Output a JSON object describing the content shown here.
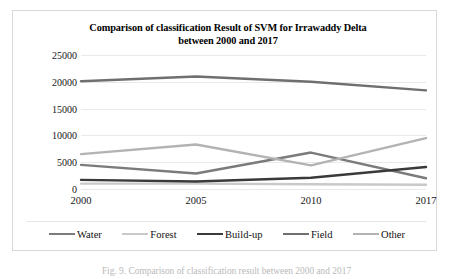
{
  "figure": {
    "caption": "Fig. 9.   Comparison of classification result between 2000 and 2017"
  },
  "chart_data": {
    "type": "line",
    "title": "Comparison of classification Result of SVM for Irrawaddy Delta between 2000 and 2017",
    "title_line1": "Comparison of classification Result of SVM for Irrawaddy Delta",
    "title_line2": "between 2000 and 2017",
    "xlabel": "",
    "ylabel": "",
    "categories": [
      "2000",
      "2005",
      "2010",
      "2017"
    ],
    "ylim": [
      0,
      25000
    ],
    "ytick_labels": [
      "25000",
      "20000",
      "15000",
      "10000",
      "5000",
      "0"
    ],
    "ytick_values": [
      25000,
      20000,
      15000,
      10000,
      5000,
      0
    ],
    "grid": true,
    "legend_position": "bottom",
    "series": [
      {
        "name": "Water",
        "color": "#7b7b7b",
        "values": [
          4500,
          2900,
          6800,
          2000
        ]
      },
      {
        "name": "Forest",
        "color": "#c9c9c9",
        "values": [
          1000,
          1000,
          900,
          800
        ]
      },
      {
        "name": "Build-up",
        "color": "#3a3a3a",
        "values": [
          1700,
          1400,
          2100,
          4100
        ]
      },
      {
        "name": "Field",
        "color": "#6f6f6f",
        "values": [
          20100,
          21000,
          20000,
          18400
        ]
      },
      {
        "name": "Other",
        "color": "#b3b3b3",
        "values": [
          6500,
          8300,
          4400,
          9500
        ]
      }
    ]
  }
}
